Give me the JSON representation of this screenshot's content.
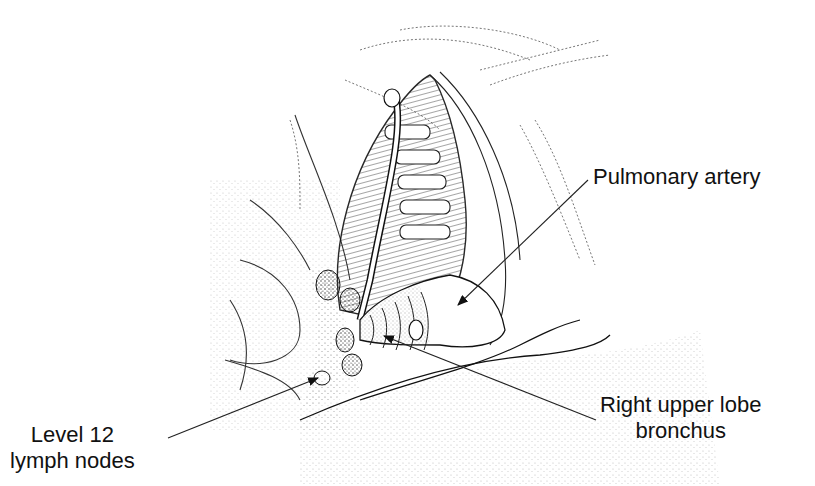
{
  "figure": {
    "type": "anatomical-illustration"
  },
  "labels": {
    "pulmonary_artery": {
      "lines": [
        "Pulmonary artery"
      ]
    },
    "lymph_nodes": {
      "lines": [
        "Level 12",
        "lymph nodes"
      ]
    },
    "bronchus": {
      "lines": [
        "Right upper lobe",
        "bronchus"
      ]
    }
  },
  "colors": {
    "ink": "#111111",
    "background": "#ffffff",
    "stipple": "#555555"
  }
}
